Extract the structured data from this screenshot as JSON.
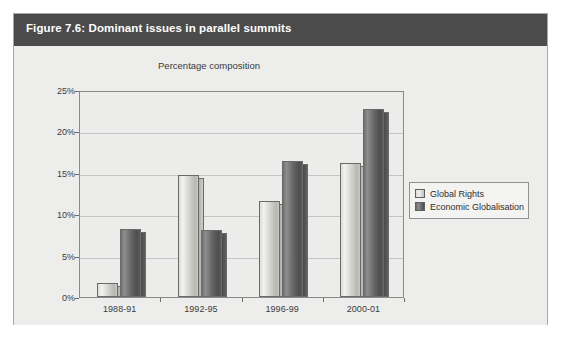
{
  "figure": {
    "title": "Figure 7.6: Dominant issues in parallel summits",
    "header_color": "#4b4b4b",
    "background_color": "#ededeb",
    "border_color": "#a8a8a8"
  },
  "chart_data": {
    "type": "bar",
    "title": "Percentage composition",
    "xlabel": "",
    "ylabel": "",
    "ylim": [
      0,
      25
    ],
    "yticks": [
      "0%",
      "5%",
      "10%",
      "15%",
      "20%",
      "25%"
    ],
    "ytick_values": [
      0,
      5,
      10,
      15,
      20,
      25
    ],
    "grid": true,
    "legend_position": "right",
    "categories": [
      "1988-91",
      "1992-95",
      "1996-99",
      "2000-01"
    ],
    "series": [
      {
        "name": "Global Rights",
        "color": "#d2d2cf",
        "values": [
          1.7,
          14.7,
          11.6,
          16.2
        ]
      },
      {
        "name": "Economic Globalisation",
        "color": "#626262",
        "values": [
          8.2,
          8.1,
          16.4,
          22.7
        ]
      }
    ]
  },
  "legend": {
    "entries": [
      {
        "label": "Global Rights",
        "swatch": "light-swatch-icon"
      },
      {
        "label": "Economic Globalisation",
        "swatch": "dark-swatch-icon"
      }
    ]
  }
}
